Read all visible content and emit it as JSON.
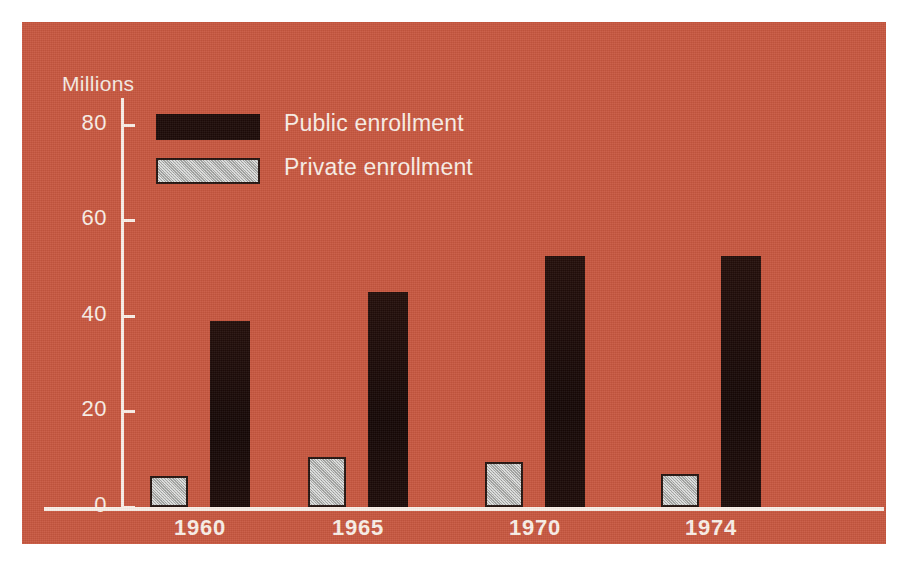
{
  "figure": {
    "background_color": "#ffffff",
    "plate_color": "#c8573f",
    "ink_color": "#fbf0e8"
  },
  "legend": {
    "position": "top-left-inside",
    "items": [
      {
        "label": "Public enrollment",
        "swatch": "public-swatch",
        "color": "#1d0b08"
      },
      {
        "label": "Private enrollment",
        "swatch": "private-swatch",
        "color": "#b9bbb8"
      }
    ]
  },
  "chart_data": {
    "type": "bar",
    "title": "",
    "subtitle": "",
    "xlabel": "",
    "ylabel": "Millions",
    "categories": [
      "1960",
      "1965",
      "1970",
      "1974"
    ],
    "series": [
      {
        "name": "Private enrollment",
        "color": "#b9bbb8",
        "values": [
          6.5,
          10.5,
          9.5,
          7.0
        ]
      },
      {
        "name": "Public enrollment",
        "color": "#1d0b08",
        "values": [
          39,
          45,
          52.5,
          52.5
        ]
      }
    ],
    "ylim": [
      0,
      88
    ],
    "yticks": [
      0,
      20,
      40,
      60,
      80
    ],
    "ytick_labels": [
      "0",
      "20",
      "40",
      "60",
      "80"
    ],
    "xtick_labels": [
      "1960",
      "1965",
      "1970",
      "1974"
    ],
    "grid": false,
    "legend_position": "upper left"
  }
}
